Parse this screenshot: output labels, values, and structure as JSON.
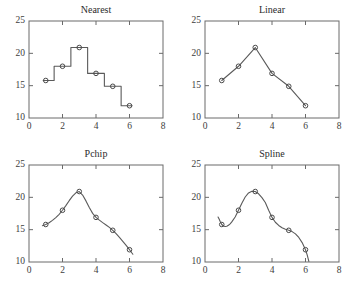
{
  "figure": {
    "background": "#ffffff",
    "line_color": "#5a5a5a",
    "axis_color": "#6a6a6a",
    "marker_color": "#4a4a4a"
  },
  "chart_data": [
    {
      "type": "line",
      "title": "Nearest",
      "xlabel": "",
      "ylabel": "",
      "xlim": [
        0,
        8
      ],
      "ylim": [
        10,
        25
      ],
      "xticks": [
        0,
        2,
        4,
        6,
        8
      ],
      "yticks": [
        10,
        15,
        20,
        25
      ],
      "grid": false,
      "legend": "none",
      "interpolation": "nearest",
      "x": [
        1,
        2,
        3,
        4,
        5,
        6
      ],
      "values": [
        15.8,
        18.0,
        20.9,
        16.9,
        14.9,
        11.9
      ],
      "curve_x": [
        0.85,
        1.5,
        1.5,
        2.5,
        2.5,
        3.5,
        3.5,
        4.5,
        4.5,
        5.5,
        5.5,
        6.15
      ],
      "curve_y": [
        15.8,
        15.8,
        18.0,
        18.0,
        20.9,
        20.9,
        16.9,
        16.9,
        14.9,
        14.9,
        11.9,
        11.9
      ]
    },
    {
      "type": "line",
      "title": "Linear",
      "xlabel": "",
      "ylabel": "",
      "xlim": [
        0,
        8
      ],
      "ylim": [
        10,
        25
      ],
      "xticks": [
        0,
        2,
        4,
        6,
        8
      ],
      "yticks": [
        10,
        15,
        20,
        25
      ],
      "grid": false,
      "legend": "none",
      "interpolation": "linear",
      "x": [
        1,
        2,
        3,
        4,
        5,
        6
      ],
      "values": [
        15.8,
        18.0,
        20.9,
        16.9,
        14.9,
        11.9
      ],
      "curve_x": [
        1,
        2,
        3,
        4,
        5,
        6
      ],
      "curve_y": [
        15.8,
        18.0,
        20.9,
        16.9,
        14.9,
        11.9
      ]
    },
    {
      "type": "line",
      "title": "Pchip",
      "xlabel": "",
      "ylabel": "",
      "xlim": [
        0,
        8
      ],
      "ylim": [
        10,
        25
      ],
      "xticks": [
        0,
        2,
        4,
        6,
        8
      ],
      "yticks": [
        10,
        15,
        20,
        25
      ],
      "grid": false,
      "legend": "none",
      "interpolation": "pchip",
      "x": [
        1,
        2,
        3,
        4,
        5,
        6
      ],
      "values": [
        15.8,
        18.0,
        20.9,
        16.9,
        14.9,
        11.9
      ],
      "curve_x": [
        0.8,
        1.0,
        1.2,
        1.4,
        1.6,
        1.8,
        2.0,
        2.2,
        2.4,
        2.6,
        2.8,
        3.0,
        3.2,
        3.4,
        3.6,
        3.8,
        4.0,
        4.2,
        4.4,
        4.6,
        4.8,
        5.0,
        5.2,
        5.4,
        5.6,
        5.8,
        6.0,
        6.2
      ],
      "curve_y": [
        15.62,
        15.8,
        16.07,
        16.44,
        16.87,
        17.38,
        18.0,
        18.72,
        19.48,
        20.18,
        20.7,
        20.9,
        20.35,
        19.45,
        18.42,
        17.52,
        16.9,
        16.47,
        16.09,
        15.73,
        15.35,
        14.9,
        14.38,
        13.8,
        13.2,
        12.56,
        11.9,
        11.2
      ]
    },
    {
      "type": "line",
      "title": "Spline",
      "xlabel": "",
      "ylabel": "",
      "xlim": [
        0,
        8
      ],
      "ylim": [
        10,
        25
      ],
      "xticks": [
        0,
        2,
        4,
        6,
        8
      ],
      "yticks": [
        10,
        15,
        20,
        25
      ],
      "grid": false,
      "legend": "none",
      "interpolation": "spline",
      "x": [
        1,
        2,
        3,
        4,
        5,
        6
      ],
      "values": [
        15.8,
        18.0,
        20.9,
        16.9,
        14.9,
        11.9
      ],
      "curve_x": [
        0.78,
        0.85,
        0.9,
        1.0,
        1.1,
        1.2,
        1.3,
        1.4,
        1.5,
        1.6,
        1.8,
        2.0,
        2.2,
        2.4,
        2.6,
        2.8,
        3.0,
        3.2,
        3.4,
        3.6,
        3.8,
        4.0,
        4.2,
        4.4,
        4.6,
        4.8,
        5.0,
        5.2,
        5.4,
        5.6,
        5.8,
        6.0,
        6.1,
        6.2
      ],
      "curve_y": [
        16.95,
        16.6,
        16.3,
        15.8,
        15.57,
        15.5,
        15.54,
        15.68,
        15.9,
        16.2,
        16.95,
        18.0,
        19.1,
        20.05,
        20.68,
        20.95,
        20.9,
        20.55,
        19.95,
        19.2,
        18.0,
        16.9,
        16.15,
        15.65,
        15.3,
        15.05,
        14.9,
        14.7,
        14.35,
        13.8,
        13.0,
        11.9,
        11.1,
        10.1
      ]
    }
  ]
}
